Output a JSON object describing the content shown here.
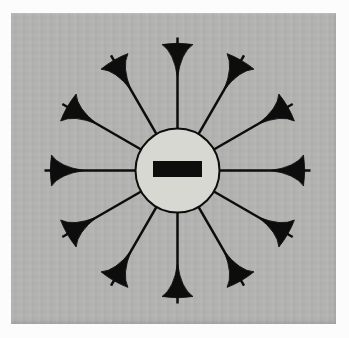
{
  "figure": {
    "type": "physics-field-diagram",
    "charge": {
      "sign": "negative",
      "symbol": "−"
    },
    "field_lines": {
      "count": 12,
      "angle_spacing_deg": 30,
      "angles_deg": [
        0,
        30,
        60,
        90,
        120,
        150,
        180,
        210,
        240,
        270,
        300,
        330
      ],
      "arrow_direction": "inward"
    },
    "colors": {
      "page_margin": "#fcfcfc",
      "paper_gray": "#b3b3b1",
      "charge_fill": "#d8d8d2",
      "ink": "#0d0d0d"
    },
    "geometry": {
      "canvas_w": 349,
      "canvas_h": 338,
      "center_x": 177.5,
      "center_y": 170.5,
      "circle_radius": 42,
      "circle_stroke_width": 2,
      "minus_bar_w": 49,
      "minus_bar_h": 16,
      "minus_bar_dy": -1.5,
      "line_inner_r": 42,
      "line_outer_r": 133,
      "line_width": 2.5,
      "arrow_tip_r": 93,
      "arrow_back_r": 126,
      "arrow_half_width": 15.5,
      "arrow_side_ctrl_back_offset": 8,
      "arrow_side_ctrl_half_width": 3.5,
      "arrow_back_bulge": 2.5
    }
  }
}
